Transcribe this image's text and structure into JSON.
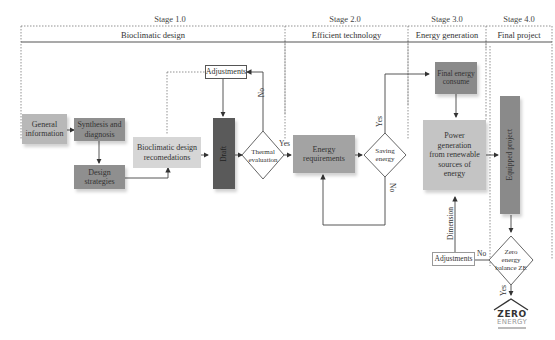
{
  "stages": [
    {
      "id": "stage1",
      "label": "Stage 1.0",
      "section": "Bioclimatic design"
    },
    {
      "id": "stage2",
      "label": "Stage 2.0",
      "section": "Efficient technology"
    },
    {
      "id": "stage3",
      "label": "Stage 3.0",
      "section": "Energy generation"
    },
    {
      "id": "stage4",
      "label": "Stage 4.0",
      "section": "Final project"
    }
  ],
  "nodes": {
    "general_information": "General information",
    "synthesis_diagnosis": "Synthesis and diagnosis",
    "design_strategies": "Design strategies",
    "bioclimatic_recommendations": "Bioclimatic design recomedations",
    "adjustments_top": "Adjustments",
    "draft": "Draft",
    "thermal_evaluation": "Thermal evaluation",
    "energy_requirements": "Energy requirements",
    "saving_energy": "Saving energy",
    "final_energy_consume": "Final energy consume",
    "power_generation": "Power generation from renewable sources of energy",
    "equipped_project": "Equipped project",
    "adjustments_bottom": "Adjustments",
    "zero_energy_balance": "Zero energy balance ZE"
  },
  "edge_labels": {
    "thermal_no": "No",
    "thermal_yes": "Yes",
    "saving_yes": "Yes",
    "saving_no": "No",
    "dimension": "Dimension",
    "ze_no": "No",
    "ze_yes": "Yes"
  },
  "logo": {
    "line1": "ZERO",
    "line2": "ENERGY"
  },
  "colors": {
    "light_box": "#cfcfcf",
    "mid_box": "#9e9e9e",
    "dark_box": "#5f5f5f",
    "green_like_box": "#bdbdbd",
    "line": "#555555"
  }
}
